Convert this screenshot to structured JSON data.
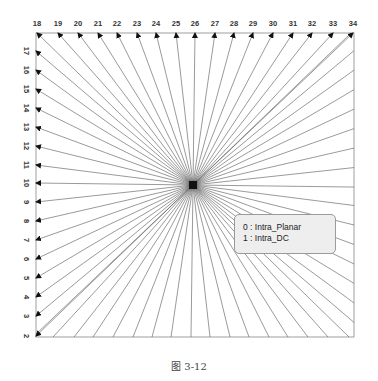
{
  "diagram": {
    "center": {
      "x": 193,
      "y": 185
    },
    "frame": {
      "left": 36,
      "top": 33,
      "right": 354,
      "bottom": 337
    },
    "top_modes": [
      {
        "mode": "18",
        "x": 37
      },
      {
        "mode": "19",
        "x": 58
      },
      {
        "mode": "20",
        "x": 78
      },
      {
        "mode": "21",
        "x": 98
      },
      {
        "mode": "22",
        "x": 117
      },
      {
        "mode": "23",
        "x": 137
      },
      {
        "mode": "24",
        "x": 156
      },
      {
        "mode": "25",
        "x": 176
      },
      {
        "mode": "26",
        "x": 195
      },
      {
        "mode": "27",
        "x": 215
      },
      {
        "mode": "28",
        "x": 234
      },
      {
        "mode": "29",
        "x": 253
      },
      {
        "mode": "30",
        "x": 273
      },
      {
        "mode": "31",
        "x": 293
      },
      {
        "mode": "32",
        "x": 312
      },
      {
        "mode": "33",
        "x": 333
      },
      {
        "mode": "34",
        "x": 353
      }
    ],
    "left_modes": [
      {
        "mode": "17",
        "y": 51
      },
      {
        "mode": "16",
        "y": 70
      },
      {
        "mode": "15",
        "y": 89
      },
      {
        "mode": "14",
        "y": 108
      },
      {
        "mode": "13",
        "y": 127
      },
      {
        "mode": "12",
        "y": 146
      },
      {
        "mode": "11",
        "y": 165
      },
      {
        "mode": "10",
        "y": 183
      },
      {
        "mode": "9",
        "y": 202
      },
      {
        "mode": "8",
        "y": 221
      },
      {
        "mode": "7",
        "y": 240
      },
      {
        "mode": "6",
        "y": 259
      },
      {
        "mode": "5",
        "y": 278
      },
      {
        "mode": "4",
        "y": 297
      },
      {
        "mode": "3",
        "y": 316
      },
      {
        "mode": "2",
        "y": 336
      }
    ],
    "colors": {
      "line": "#555555",
      "frame": "#888888",
      "arrow": "#111111"
    }
  },
  "legend": {
    "items": [
      {
        "index": "0",
        "label": "0  :  Intra_Planar"
      },
      {
        "index": "1",
        "label": "1  :  Intra_DC"
      }
    ]
  },
  "caption": "图 3-12"
}
